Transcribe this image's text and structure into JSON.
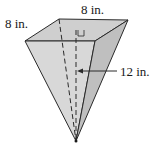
{
  "figure": {
    "shape": "inverted square pyramid",
    "labels": {
      "base_left_edge": "8 in.",
      "base_top_edge": "8 in.",
      "height": "12 in."
    },
    "colors": {
      "top_face": "#c9c9c9",
      "front_face": "#d6d6d6",
      "right_face": "#bdbdbd",
      "edge": "#2a2a2a",
      "background": "#ffffff"
    }
  }
}
